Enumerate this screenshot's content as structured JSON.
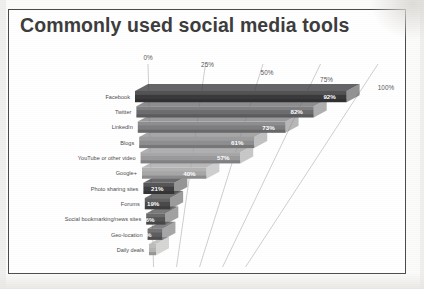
{
  "figure": {
    "title": "Commonly used social media tools",
    "background_color": "#ffffff",
    "frame_color": "#4a4a4a"
  },
  "chart_data": {
    "type": "bar",
    "orientation": "horizontal",
    "style": "3d-perspective-stacked-horizontal-bars",
    "title": "Commonly used social media tools",
    "xlabel": "",
    "ylabel": "",
    "xlim": [
      0,
      100
    ],
    "grid": true,
    "legend": "none",
    "unit": "%",
    "categories": [
      "Facebook",
      "Twitter",
      "LinkedIn",
      "Blogs",
      "YouTube or other video",
      "Google+",
      "Photo sharing sites",
      "Forums",
      "Social bookmarking/news sites",
      "Geo-location",
      "Daily deals"
    ],
    "values": [
      92,
      82,
      73,
      61,
      57,
      40,
      21,
      19,
      16,
      14,
      6
    ],
    "data_labels": [
      "92%",
      "82%",
      "73%",
      "61%",
      "57%",
      "40%",
      "21%",
      "19%",
      "16%",
      "14%",
      ""
    ],
    "xticks": [
      0,
      25,
      50,
      75,
      100
    ],
    "xticklabels": [
      "0%",
      "25%",
      "50%",
      "75%",
      "100%"
    ],
    "bar_colors": [
      "#3a3a3c",
      "#6d6d6f",
      "#7e7e80",
      "#8e8e90",
      "#9a9a9c",
      "#a7a7a8",
      "#3f3f41",
      "#4a4a4c",
      "#555557",
      "#5f5f61",
      "#b4b4b2"
    ]
  }
}
